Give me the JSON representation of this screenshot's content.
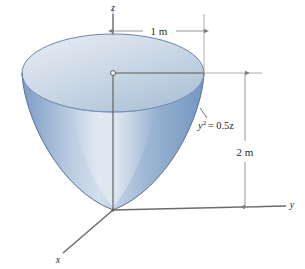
{
  "figure": {
    "axes": {
      "z_label": "z",
      "y_label": "y",
      "x_label": "x"
    },
    "dimensions": {
      "radius_label": "1 m",
      "height_label": "2 m"
    },
    "equation": {
      "base": "y",
      "exponent": "2",
      "rest": "= 0.5z",
      "full": "y2 = 0.5z"
    },
    "colors": {
      "surface_light": "#cdd9e8",
      "surface_mid": "#9fb7d4",
      "surface_dark": "#6e8fba",
      "top_face_light": "#dfe7f1",
      "top_face_dark": "#aebfd6",
      "outline": "#5a7298",
      "axis": "#6b6b6b",
      "dimension_line": "#8a8a8a",
      "text": "#2b2b2b",
      "background": "#ffffff"
    }
  }
}
